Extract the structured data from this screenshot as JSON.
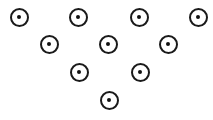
{
  "figure": {
    "width": 213,
    "height": 120,
    "background_color": "#ffffff",
    "marker_style": {
      "ring_color": "#1a1a1a",
      "ring_stroke_width": 2,
      "ring_fill_color": "#ffffff",
      "core_color": "#111111",
      "outer_diameter": 19,
      "core_diameter": 4.5,
      "shape": "ring-with-center-dot"
    },
    "arrangement": "triangle",
    "row_count": 4,
    "marker_count": 10,
    "rows": [
      {
        "index": 1,
        "count": 4,
        "y": 17
      },
      {
        "index": 2,
        "count": 3,
        "y": 44
      },
      {
        "index": 3,
        "count": 2,
        "y": 72
      },
      {
        "index": 4,
        "count": 1,
        "y": 100
      }
    ]
  },
  "chart_data": {
    "type": "scatter",
    "xlabel": "",
    "ylabel": "",
    "xlim": [
      0,
      213
    ],
    "ylim": [
      0,
      120
    ],
    "grid": false,
    "legend": null,
    "series": [
      {
        "name": "markers",
        "marker": "ring-with-center-dot",
        "color": "#1a1a1a",
        "size": 19,
        "points": [
          {
            "id": 1,
            "row": 1,
            "col": 1,
            "x": 19,
            "y": 17
          },
          {
            "id": 2,
            "row": 1,
            "col": 2,
            "x": 78,
            "y": 17
          },
          {
            "id": 3,
            "row": 1,
            "col": 3,
            "x": 139,
            "y": 17
          },
          {
            "id": 4,
            "row": 1,
            "col": 4,
            "x": 198,
            "y": 17
          },
          {
            "id": 5,
            "row": 2,
            "col": 1,
            "x": 49,
            "y": 44
          },
          {
            "id": 6,
            "row": 2,
            "col": 2,
            "x": 108,
            "y": 44
          },
          {
            "id": 7,
            "row": 2,
            "col": 3,
            "x": 168,
            "y": 44
          },
          {
            "id": 8,
            "row": 3,
            "col": 1,
            "x": 79,
            "y": 72
          },
          {
            "id": 9,
            "row": 3,
            "col": 2,
            "x": 140,
            "y": 72
          },
          {
            "id": 10,
            "row": 4,
            "col": 1,
            "x": 109,
            "y": 100
          }
        ]
      }
    ]
  }
}
